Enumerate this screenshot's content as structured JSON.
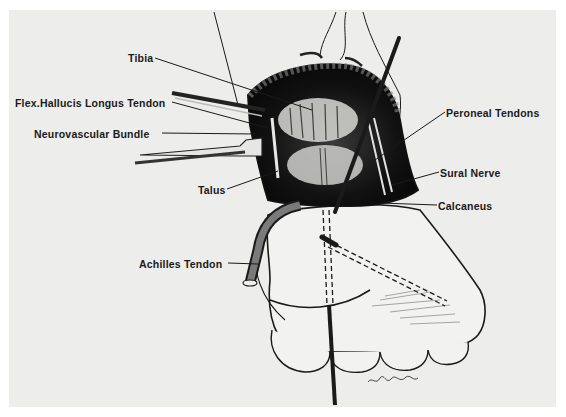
{
  "figure": {
    "colors": {
      "paper": "#ededeb",
      "ink": "#1a1a1a",
      "border": "#ffffff"
    },
    "signature": "Alberto"
  },
  "labels": [
    {
      "id": "tibia",
      "text": "Tibia",
      "x": 128,
      "y": 52,
      "anchor_end": [
        312,
        110
      ]
    },
    {
      "id": "flex-hallucis-longus-tendon",
      "text": "Flex.Hallucis Longus Tendon",
      "x": 15,
      "y": 97,
      "anchor_end": [
        268,
        128
      ]
    },
    {
      "id": "neurovascular-bundle",
      "text": "Neurovascular Bundle",
      "x": 34,
      "y": 128,
      "anchor_end": [
        255,
        134
      ]
    },
    {
      "id": "talus",
      "text": "Talus",
      "x": 198,
      "y": 184,
      "anchor_end": [
        278,
        171
      ]
    },
    {
      "id": "peroneal-tendons",
      "text": "Peroneal Tendons",
      "x": 446,
      "y": 107,
      "anchor_end": [
        375,
        160
      ]
    },
    {
      "id": "sural-nerve",
      "text": "Sural Nerve",
      "x": 440,
      "y": 167,
      "anchor_end": [
        392,
        185
      ]
    },
    {
      "id": "calcaneus",
      "text": "Calcaneus",
      "x": 438,
      "y": 200,
      "anchor_end": [
        380,
        203
      ]
    },
    {
      "id": "achilles-tendon",
      "text": "Achilles Tendon",
      "x": 139,
      "y": 258,
      "anchor_end": [
        258,
        264
      ]
    }
  ]
}
